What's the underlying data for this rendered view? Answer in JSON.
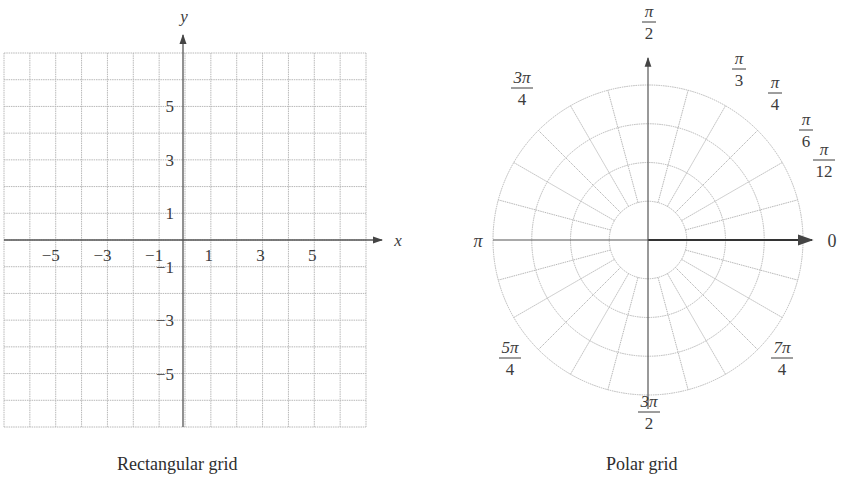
{
  "rectangular": {
    "caption": "Rectangular grid",
    "x_axis_label": "x",
    "y_axis_label": "y",
    "x_ticks": [
      {
        "value": -5,
        "label": "−5"
      },
      {
        "value": -3,
        "label": "−3"
      },
      {
        "value": -1,
        "label": "−1"
      },
      {
        "value": 1,
        "label": "1"
      },
      {
        "value": 3,
        "label": "3"
      },
      {
        "value": 5,
        "label": "5"
      }
    ],
    "y_ticks": [
      {
        "value": 5,
        "label": "5"
      },
      {
        "value": 3,
        "label": "3"
      },
      {
        "value": 1,
        "label": "1"
      },
      {
        "value": -1,
        "label": "−1"
      },
      {
        "value": -3,
        "label": "−3"
      },
      {
        "value": -5,
        "label": "−5"
      }
    ],
    "x_range": [
      -7,
      7
    ],
    "y_range": [
      -7,
      7
    ],
    "grid_step": 1
  },
  "polar": {
    "caption": "Polar grid",
    "circle_count": 4,
    "radial_step": "π/12",
    "angle_labels": [
      {
        "angle_deg": 0,
        "num": "0",
        "den": ""
      },
      {
        "angle_deg": 15,
        "num": "π",
        "den": "12"
      },
      {
        "angle_deg": 30,
        "num": "π",
        "den": "6"
      },
      {
        "angle_deg": 45,
        "num": "π",
        "den": "4"
      },
      {
        "angle_deg": 60,
        "num": "π",
        "den": "3"
      },
      {
        "angle_deg": 90,
        "num": "π",
        "den": "2"
      },
      {
        "angle_deg": 135,
        "num": "3π",
        "den": "4"
      },
      {
        "angle_deg": 180,
        "num": "π",
        "den": ""
      },
      {
        "angle_deg": 225,
        "num": "5π",
        "den": "4"
      },
      {
        "angle_deg": 270,
        "num": "3π",
        "den": "2"
      },
      {
        "angle_deg": 315,
        "num": "7π",
        "den": "4"
      }
    ]
  },
  "colors": {
    "grid": "#b8b8b8",
    "axis": "#555555",
    "text": "#3c3c3c"
  }
}
